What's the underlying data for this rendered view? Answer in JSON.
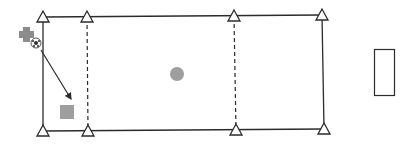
{
  "diagram": {
    "type": "sports-drill-field",
    "colors": {
      "line": "#2b2b2b",
      "cone_fill": "#ffffff",
      "marker_gray": "#9e9e9e",
      "player_gray": "#8c8c8c",
      "background": "#ffffff"
    },
    "field": {
      "top_left": [
        43,
        17
      ],
      "top_right": [
        322,
        15
      ],
      "bottom_left": [
        43,
        131
      ],
      "bottom_right": [
        324,
        129
      ]
    },
    "zone_lines": [
      {
        "name": "dashed-line-left",
        "top": [
          87,
          18
        ],
        "bottom": [
          88,
          131
        ],
        "style": "dashed"
      },
      {
        "name": "dashed-line-right",
        "top": [
          234,
          17
        ],
        "bottom": [
          236,
          130
        ],
        "style": "dashed"
      }
    ],
    "cones": [
      {
        "name": "cone-top-left",
        "x": 43,
        "y": 17
      },
      {
        "name": "cone-top-2",
        "x": 87,
        "y": 17
      },
      {
        "name": "cone-top-3",
        "x": 234,
        "y": 16
      },
      {
        "name": "cone-top-right",
        "x": 322,
        "y": 15
      },
      {
        "name": "cone-bottom-left",
        "x": 43,
        "y": 131
      },
      {
        "name": "cone-bottom-2",
        "x": 88,
        "y": 131
      },
      {
        "name": "cone-bottom-3",
        "x": 236,
        "y": 130
      },
      {
        "name": "cone-bottom-right",
        "x": 324,
        "y": 129
      }
    ],
    "player": {
      "name": "player-cross",
      "x": 27,
      "y": 34
    },
    "ball": {
      "name": "ball",
      "x": 36,
      "y": 43,
      "r": 5
    },
    "pass_arrow": {
      "from": [
        41,
        50
      ],
      "to": [
        71,
        99
      ]
    },
    "center_marker": {
      "name": "center-circle",
      "x": 177,
      "y": 74,
      "r": 7
    },
    "target_square": {
      "name": "target-square",
      "x": 60,
      "y": 105,
      "size": 14
    },
    "goal": {
      "name": "goal-rectangle",
      "x": 374,
      "y": 49,
      "w": 20,
      "h": 46
    }
  }
}
